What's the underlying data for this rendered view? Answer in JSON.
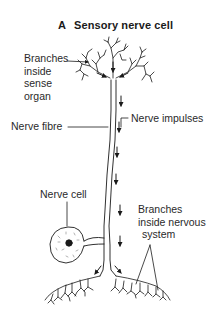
{
  "title": {
    "letter": "A",
    "text": "Sensory nerve cell"
  },
  "labels": {
    "branches_sense": [
      "Branches",
      "inside",
      "sense",
      "organ"
    ],
    "nerve_fibre": "Nerve fibre",
    "nerve_impulses": "Nerve impulses",
    "nerve_cell": "Nerve cell",
    "branches_nervous": [
      "Branches",
      "inside nervous",
      "system"
    ]
  },
  "colors": {
    "ink": "#1a1a1a",
    "background": "#ffffff"
  }
}
